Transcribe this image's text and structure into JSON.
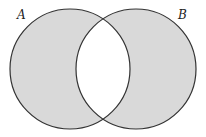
{
  "diagram": {
    "type": "venn",
    "sets": [
      {
        "label": "A",
        "cx": 70,
        "cy": 69,
        "r": 60,
        "shaded": true
      },
      {
        "label": "B",
        "cx": 136,
        "cy": 69,
        "r": 60,
        "shaded": true
      }
    ],
    "intersection_shaded": false,
    "colors": {
      "fill": "#d9d9d9",
      "stroke": "#333333",
      "background": "#ffffff",
      "intersection": "#ffffff"
    }
  },
  "labels": {
    "a": "A",
    "b": "B"
  }
}
